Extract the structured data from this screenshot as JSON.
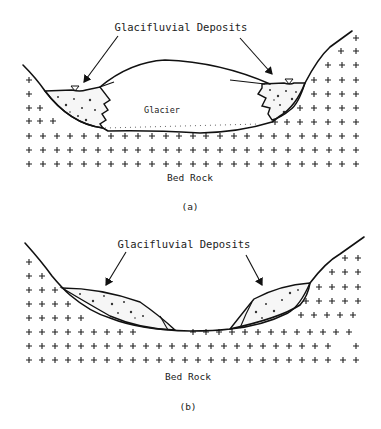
{
  "figure": {
    "panels": [
      {
        "id": "a",
        "caption": "(a)",
        "title_label": "Glacifluvial Deposits",
        "glacier_label": "Glacier",
        "bedrock_label": "Bed Rock"
      },
      {
        "id": "b",
        "caption": "(b)",
        "title_label": "Glacifluvial Deposits",
        "bedrock_label": "Bed Rock"
      }
    ],
    "colors": {
      "ink": "#111111",
      "background": "#ffffff"
    }
  }
}
